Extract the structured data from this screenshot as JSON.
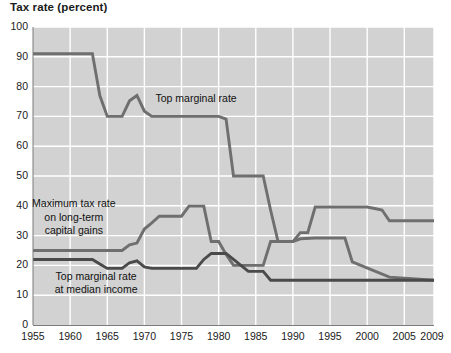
{
  "chart_data": {
    "type": "line",
    "title": "Tax rate (percent)",
    "xlabel": "",
    "ylabel": "Tax rate (percent)",
    "xlim": [
      1955,
      2009
    ],
    "ylim": [
      0,
      100
    ],
    "grid": true,
    "legend_position": "inline-annotations",
    "y_ticks": [
      0,
      10,
      20,
      30,
      40,
      50,
      60,
      70,
      80,
      90,
      100
    ],
    "x_ticks": [
      1955,
      1960,
      1965,
      1970,
      1975,
      1980,
      1985,
      1990,
      1995,
      2000,
      2005,
      2009
    ],
    "x_tick_labels": [
      "1955",
      "1960",
      "1965",
      "1970",
      "1975",
      "1980",
      "1985",
      "1990",
      "1995",
      "2000",
      "2005",
      "2009"
    ],
    "y_tick_labels": [
      "0",
      "10",
      "20",
      "30",
      "40",
      "50",
      "60",
      "70",
      "80",
      "90",
      "100"
    ],
    "annotations": [
      {
        "id": "top-marginal-rate",
        "text": "Top marginal rate",
        "lines": [
          "Top marginal rate"
        ],
        "x": 1971.5,
        "y": 76
      },
      {
        "id": "max-capital-gains",
        "text": "Maximum tax rate on long-term capital gains",
        "lines": [
          "Maximum tax rate",
          "on long-term",
          "capital gains"
        ],
        "x": 1960.5,
        "y": 36
      },
      {
        "id": "top-marginal-median",
        "text": "Top marginal rate at median income",
        "lines": [
          "Top marginal rate",
          "at median income"
        ],
        "x": 1963.5,
        "y": 14
      }
    ],
    "series": [
      {
        "name": "Top marginal rate",
        "color": "#6f6f6f",
        "x": [
          1955,
          1963,
          1964,
          1965,
          1966,
          1967,
          1968,
          1969,
          1970,
          1971,
          1972,
          1976,
          1977,
          1980,
          1981,
          1982,
          1986,
          1987,
          1988,
          1990,
          1991,
          1992,
          1993,
          1994,
          2000,
          2001,
          2002,
          2003,
          2009
        ],
        "values": [
          91,
          91,
          77,
          70,
          70,
          70,
          75.25,
          77,
          71.75,
          70,
          70,
          70,
          70,
          70,
          69.125,
          50,
          50,
          38.5,
          28,
          28,
          31,
          31,
          39.6,
          39.6,
          39.6,
          39.1,
          38.6,
          35,
          35
        ]
      },
      {
        "name": "Maximum tax rate on long-term capital gains",
        "color": "#6f6f6f",
        "x": [
          1955,
          1967,
          1968,
          1969,
          1970,
          1971,
          1972,
          1975,
          1976,
          1977,
          1978,
          1979,
          1980,
          1981,
          1982,
          1986,
          1987,
          1988,
          1990,
          1991,
          1993,
          1997,
          1998,
          2003,
          2009
        ],
        "values": [
          25,
          25,
          26.9,
          27.5,
          32.21,
          34.25,
          36.5,
          36.5,
          39.875,
          39.875,
          39.875,
          28,
          28,
          23.7,
          20,
          20,
          28,
          28,
          28,
          28.93,
          29.19,
          29.19,
          21.19,
          16.05,
          15
        ]
      },
      {
        "name": "Top marginal rate at median income",
        "color": "#4a4a4a",
        "x": [
          1955,
          1963,
          1964,
          1965,
          1966,
          1967,
          1968,
          1969,
          1970,
          1971,
          1972,
          1977,
          1978,
          1979,
          1981,
          1982,
          1983,
          1984,
          1986,
          1987,
          1988,
          1990,
          1991,
          2000,
          2001,
          2002,
          2003,
          2009
        ],
        "values": [
          22,
          22,
          20.5,
          19,
          19,
          19,
          20.9,
          21.5,
          19.5,
          19,
          19,
          19,
          22,
          24,
          24,
          22,
          20,
          18,
          18,
          15,
          15,
          15,
          15,
          15,
          15,
          15,
          15,
          15
        ]
      }
    ]
  }
}
